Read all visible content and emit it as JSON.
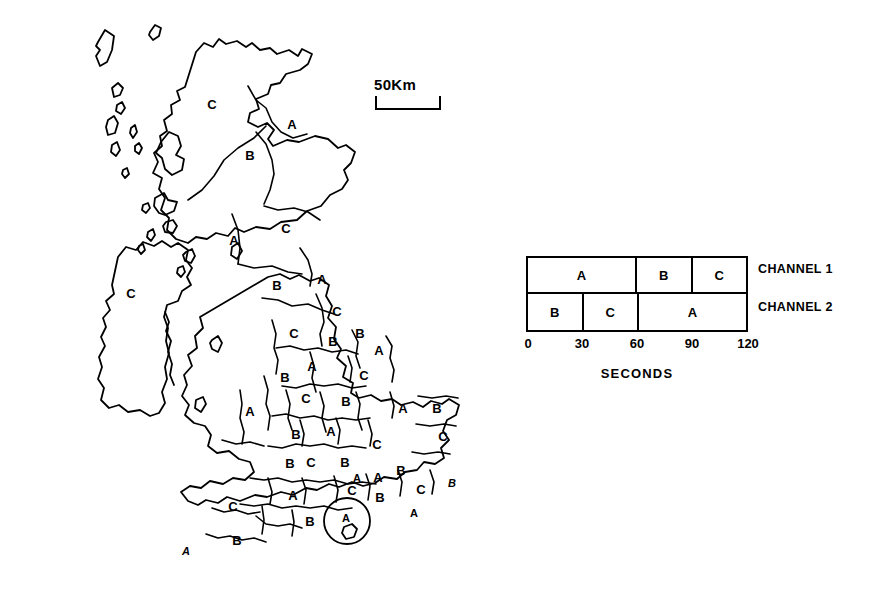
{
  "figure": {
    "type": "thematic-map-with-timing-diagram"
  },
  "map": {
    "title": "",
    "scale": {
      "label": "50Km",
      "icon": "scale-bracket-icon"
    },
    "regions": [
      {
        "id": "r01",
        "label": "C",
        "x": 212,
        "y": 104,
        "area": "north-scotland"
      },
      {
        "id": "r02",
        "label": "A",
        "x": 292,
        "y": 124,
        "area": "north-east-scotland"
      },
      {
        "id": "r03",
        "label": "B",
        "x": 250,
        "y": 155,
        "area": "east-scotland"
      },
      {
        "id": "r04",
        "label": "C",
        "x": 286,
        "y": 228,
        "area": "central-scotland"
      },
      {
        "id": "r05",
        "label": "A",
        "x": 234,
        "y": 240,
        "area": "west-scotland"
      },
      {
        "id": "r06",
        "label": "B",
        "x": 277,
        "y": 285,
        "area": "southern-uplands"
      },
      {
        "id": "r07",
        "label": "A",
        "x": 322,
        "y": 279,
        "area": "borders"
      },
      {
        "id": "r08",
        "label": "C",
        "x": 131,
        "y": 293,
        "area": "northern-ireland"
      },
      {
        "id": "r09",
        "label": "C",
        "x": 337,
        "y": 311,
        "area": "northumberland"
      },
      {
        "id": "r10",
        "label": "C",
        "x": 294,
        "y": 333,
        "area": "cumbria"
      },
      {
        "id": "r11",
        "label": "B",
        "x": 333,
        "y": 341,
        "area": "durham"
      },
      {
        "id": "r12",
        "label": "A",
        "x": 379,
        "y": 350,
        "area": "north-yorkshire-coast"
      },
      {
        "id": "r13",
        "label": "A",
        "x": 312,
        "y": 366,
        "area": "lancashire"
      },
      {
        "id": "r14",
        "label": "C",
        "x": 364,
        "y": 375,
        "area": "yorkshire"
      },
      {
        "id": "r15",
        "label": "B",
        "x": 285,
        "y": 377,
        "area": "merseyside"
      },
      {
        "id": "r16",
        "label": "C",
        "x": 306,
        "y": 398,
        "area": "cheshire"
      },
      {
        "id": "r17",
        "label": "B",
        "x": 346,
        "y": 401,
        "area": "south-yorkshire"
      },
      {
        "id": "r18",
        "label": "A",
        "x": 250,
        "y": 411,
        "area": "mid-wales"
      },
      {
        "id": "r19",
        "label": "B",
        "x": 296,
        "y": 434,
        "area": "shropshire"
      },
      {
        "id": "r20",
        "label": "A",
        "x": 331,
        "y": 431,
        "area": "staffordshire"
      },
      {
        "id": "r21",
        "label": "A",
        "x": 403,
        "y": 408,
        "area": "lincolnshire"
      },
      {
        "id": "r22",
        "label": "B",
        "x": 437,
        "y": 408,
        "area": "norfolk"
      },
      {
        "id": "r23",
        "label": "C",
        "x": 443,
        "y": 436,
        "area": "suffolk"
      },
      {
        "id": "r24",
        "label": "C",
        "x": 377,
        "y": 444,
        "area": "northamptonshire"
      },
      {
        "id": "r25",
        "label": "B",
        "x": 290,
        "y": 463,
        "area": "herefordshire"
      },
      {
        "id": "r26",
        "label": "C",
        "x": 311,
        "y": 462,
        "area": "gloucestershire"
      },
      {
        "id": "r27",
        "label": "B",
        "x": 345,
        "y": 462,
        "area": "oxfordshire"
      },
      {
        "id": "r28",
        "label": "A",
        "x": 378,
        "y": 477,
        "area": "hertfordshire"
      },
      {
        "id": "r29",
        "label": "B",
        "x": 401,
        "y": 470,
        "area": "essex"
      },
      {
        "id": "r30",
        "label": "C",
        "x": 233,
        "y": 506,
        "area": "somerset"
      },
      {
        "id": "r31",
        "label": "A",
        "x": 293,
        "y": 495,
        "area": "wiltshire"
      },
      {
        "id": "r32",
        "label": "C",
        "x": 352,
        "y": 490,
        "area": "berkshire"
      },
      {
        "id": "r33",
        "label": "B",
        "x": 380,
        "y": 497,
        "area": "surrey"
      },
      {
        "id": "r34",
        "label": "C",
        "x": 421,
        "y": 489,
        "area": "london"
      },
      {
        "id": "r35",
        "label": "B",
        "x": 452,
        "y": 483,
        "area": "kent-north",
        "style": "italic"
      },
      {
        "id": "r36",
        "label": "A",
        "x": 414,
        "y": 513,
        "area": "kent-south"
      },
      {
        "id": "r37",
        "label": "B",
        "x": 310,
        "y": 521,
        "area": "dorset"
      },
      {
        "id": "r38",
        "label": "A",
        "x": 346,
        "y": 520,
        "area": "hampshire-inset"
      },
      {
        "id": "r39",
        "label": "B",
        "x": 237,
        "y": 540,
        "area": "devon"
      },
      {
        "id": "r40",
        "label": "A",
        "x": 186,
        "y": 551,
        "area": "cornwall",
        "style": "italic"
      },
      {
        "id": "r41",
        "label": "A",
        "x": 357,
        "y": 478,
        "area": "buckinghamshire"
      },
      {
        "id": "r42",
        "label": "B",
        "x": 360,
        "y": 333,
        "area": "east-riding"
      }
    ]
  },
  "timing": {
    "axis": {
      "title": "SECONDS",
      "ticks": [
        0,
        30,
        60,
        90,
        120
      ],
      "min": 0,
      "max": 120
    },
    "channels": [
      {
        "name": "CHANNEL 1",
        "slots": [
          {
            "label": "A",
            "start": 0,
            "end": 60
          },
          {
            "label": "B",
            "start": 60,
            "end": 90
          },
          {
            "label": "C",
            "start": 90,
            "end": 120
          }
        ]
      },
      {
        "name": "CHANNEL 2",
        "slots": [
          {
            "label": "B",
            "start": 0,
            "end": 30
          },
          {
            "label": "C",
            "start": 30,
            "end": 60
          },
          {
            "label": "A",
            "start": 60,
            "end": 120
          }
        ]
      }
    ]
  },
  "colors": {
    "background": "#ffffff",
    "ink": "#000000"
  }
}
